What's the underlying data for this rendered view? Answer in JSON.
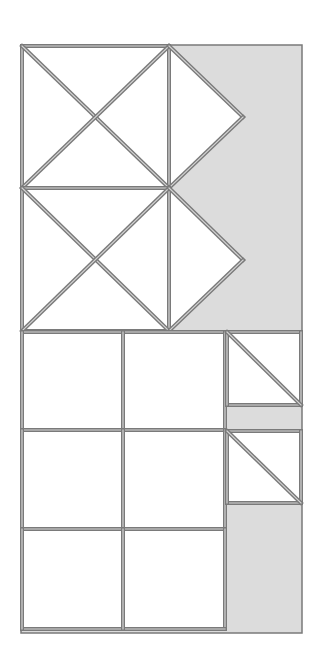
{
  "canvas": {
    "width": 321,
    "height": 663,
    "background": "#ffffff"
  },
  "colors": {
    "frame_fill": "#dcdcdc",
    "shape_fill": "#ffffff",
    "stroke_outer": "#7a7a7a",
    "stroke_inner": "#d4d4d4"
  },
  "frame": {
    "x1": 21,
    "y1": 45,
    "x2": 302,
    "y2": 633
  },
  "x_blocks": [
    {
      "name": "x-block-top",
      "x1": 22,
      "y1": 46,
      "x2": 169,
      "y2": 188,
      "tip": [
        243,
        117
      ]
    },
    {
      "name": "x-block-bottom",
      "x1": 22,
      "y1": 188,
      "x2": 169,
      "y2": 331,
      "tip": [
        243,
        260
      ]
    }
  ],
  "grid": {
    "x": [
      22,
      123,
      225
    ],
    "y": [
      332,
      430,
      529,
      629
    ]
  },
  "side_boxes": [
    {
      "name": "side-box-top",
      "x1": 227,
      "y1": 332,
      "x2": 301,
      "y2": 405
    },
    {
      "name": "side-box-bottom",
      "x1": 227,
      "y1": 431,
      "x2": 301,
      "y2": 503
    }
  ]
}
